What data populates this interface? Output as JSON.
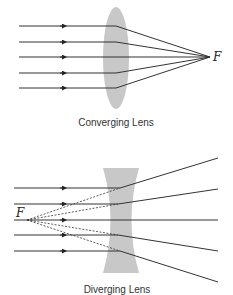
{
  "diagrams": [
    {
      "id": "converging",
      "caption": "Converging Lens",
      "focal_label": "F",
      "ray_count": 5,
      "lens_color": "#c8c8c8",
      "ray_color": "#333333"
    },
    {
      "id": "diverging",
      "caption": "Diverging Lens",
      "focal_label": "F",
      "ray_count": 5,
      "lens_color": "#c8c8c8",
      "ray_color": "#333333",
      "virtual_rays": "dashed"
    }
  ]
}
